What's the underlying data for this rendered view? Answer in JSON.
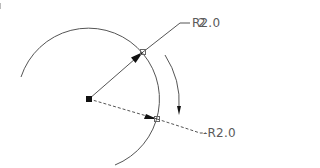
{
  "drawing": {
    "title": "Radius dimension rotation diagram",
    "stroke_color": "#555555",
    "background": "#ffffff",
    "center_point": {
      "x": 89,
      "y": 99
    },
    "arc": {
      "cx": 89,
      "cy": 99,
      "r": 71,
      "start": {
        "x": 21,
        "y": 77
      },
      "end": {
        "x": 115,
        "y": 165
      }
    },
    "original_dimension": {
      "label": "R2.0",
      "overlay_label": "2",
      "style": "solid",
      "arc_point": {
        "x": 143,
        "y": 52
      },
      "leader_end": {
        "x": 190,
        "y": 23
      }
    },
    "rotated_dimension": {
      "label": "-R2.0",
      "style": "dashed",
      "arc_point": {
        "x": 157,
        "y": 119
      },
      "leader_end": {
        "x": 205,
        "y": 133
      }
    },
    "rotation_arrow": {
      "direction": "clockwise",
      "start": {
        "x": 165,
        "y": 55
      },
      "end": {
        "x": 179,
        "y": 114
      }
    }
  }
}
